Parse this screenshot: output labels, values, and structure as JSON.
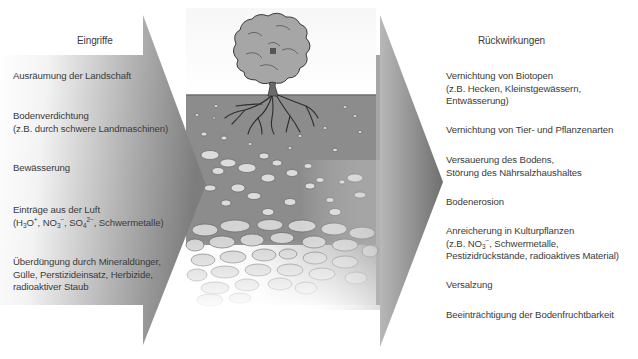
{
  "left": {
    "header": "Eingriffe",
    "items": [
      {
        "lines": [
          "Ausräumung der Landschaft"
        ]
      },
      {
        "lines": [
          "Bodenverdichtung",
          "(z.B. durch schwere Landmaschinen)"
        ]
      },
      {
        "lines": [
          "Bewässerung"
        ]
      },
      {
        "lines": [
          "Einträge aus der Luft"
        ],
        "formula": {
          "h3o": "H",
          "h3o_sub": "3",
          "h3o_o": "O",
          "h3o_sup": "+",
          "no3": "NO",
          "no3_sub": "3",
          "no3_sup": "−",
          "so4": "SO",
          "so4_sub": "4",
          "so4_sup": "2−",
          "rest": ", Schwermetalle)"
        }
      },
      {
        "lines": [
          "Überdüngung durch Mineraldünger,",
          "Gülle, Perstizideinsatz, Herbizide,",
          "radioaktiver Staub"
        ]
      }
    ]
  },
  "right": {
    "header": "Rückwirkungen",
    "items": [
      {
        "lines": [
          "Vernichtung von Biotopen",
          "(z.B. Hecken, Kleinstgewässern,",
          "Entwässerung)"
        ]
      },
      {
        "lines": [
          "Vernichtung von Tier- und Pflanzenarten"
        ]
      },
      {
        "lines": [
          "Versauerung des Bodens,",
          "Störung des Nährsalzhaushaltes"
        ]
      },
      {
        "lines": [
          "Bodenerosion"
        ]
      },
      {
        "lines": [
          "Anreicherung in Kulturpflanzen"
        ],
        "formula": {
          "prefix": "(z.B. NO",
          "no3_sub": "3",
          "no3_sup": "−",
          "rest": ", Schwermetalle,"
        },
        "extra": "Pestizidrückstände, radioaktives Material)"
      },
      {
        "lines": [
          "Versalzung"
        ]
      },
      {
        "lines": [
          "Beeinträchtigung der Bodenfruchtbarkeit"
        ]
      }
    ]
  },
  "center": {
    "illustration": "tree-with-roots-in-soil-layers",
    "soil_color": "#8c8c8c",
    "stone_color": "#d6d6d6",
    "outline_color": "#555555"
  },
  "colors": {
    "arrow_light": "#ffffff",
    "arrow_dark": "#8a8a8a",
    "text": "#3b3b3b"
  }
}
